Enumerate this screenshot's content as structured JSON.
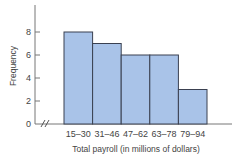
{
  "chart_data": {
    "type": "bar",
    "title": "",
    "xlabel": "Total payroll (in millions of dollars)",
    "ylabel": "Frequency",
    "categories": [
      "15–30",
      "31–46",
      "47–62",
      "63–78",
      "79–94"
    ],
    "values": [
      8,
      7,
      6,
      6,
      3
    ],
    "ylim": [
      0,
      10
    ],
    "yticks": [
      0,
      2,
      4,
      6,
      8
    ],
    "grid": false,
    "legend": null,
    "histogram": true,
    "axis_break": true,
    "colors": {
      "bar_fill": "#a9c3e8",
      "bar_edge": "#3a4050",
      "axis": "#777777"
    }
  }
}
